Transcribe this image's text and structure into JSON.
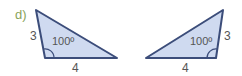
{
  "part_label": "d)",
  "colors": {
    "fill": "#cfdaf0",
    "stroke": "#3c4d7a",
    "text": "#555555",
    "part_label": "#8aa35a"
  },
  "triangles": [
    {
      "side_vertical": "3",
      "side_base": "4",
      "angle": "100º"
    },
    {
      "side_vertical": "3",
      "side_base": "4",
      "angle": "100º"
    }
  ]
}
